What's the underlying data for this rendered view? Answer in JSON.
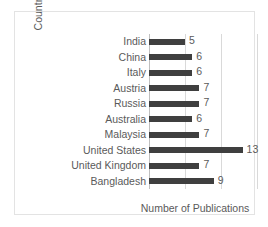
{
  "chart_data": {
    "type": "bar",
    "orientation": "horizontal",
    "title": "",
    "xlabel": "Number of Publications",
    "ylabel": "Country",
    "categories": [
      "India",
      "China",
      "Italy",
      "Austria",
      "Russia",
      "Australia",
      "Malaysia",
      "United States",
      "United Kingdom",
      "Bangladesh"
    ],
    "values": [
      5,
      6,
      6,
      7,
      7,
      6,
      7,
      13,
      7,
      9
    ],
    "data_labels": [
      "5",
      "6",
      "6",
      "7",
      "7",
      "6",
      "7",
      "13",
      "7",
      "9"
    ],
    "xlim": [
      0,
      15
    ],
    "gridline_values": [
      5,
      10,
      15
    ],
    "grid": "vertical",
    "legend": "none",
    "bar_color": "#3f3f3f",
    "gridline_color": "#d9d9d9",
    "axis_color": "#bfbfbf",
    "text_color": "#5a5a5a",
    "frame_color": "#e3e3e3",
    "background_color": "#ffffff"
  }
}
